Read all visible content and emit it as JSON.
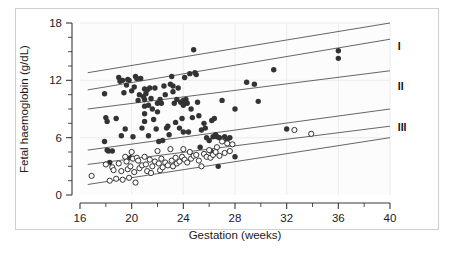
{
  "figure": {
    "background_color": "#ffffff",
    "plot_area_color": "#fcfcfc",
    "frame_color": "#cfcfcf",
    "axis_color": "#3a3a3a",
    "gridline_color": "#ececec",
    "reference_line_color": "#555555",
    "filled_marker_color": "#333333",
    "open_marker_edge_color": "#333333",
    "open_marker_fill_color": "#ffffff"
  },
  "chart_data": {
    "type": "scatter",
    "title": "",
    "subtitle": "",
    "xlabel": "Gestation (weeks)",
    "ylabel": "Fetal haemoglobin (g/dL)",
    "xlim": [
      16,
      40
    ],
    "ylim": [
      0,
      18
    ],
    "xticks": [
      16,
      20,
      24,
      28,
      32,
      36,
      40
    ],
    "xtick_labels": [
      "16",
      "20",
      "24",
      "28",
      "32",
      "36",
      "40"
    ],
    "xminor_ticks": [
      18,
      22,
      26,
      30,
      34,
      38
    ],
    "yticks": [
      0,
      6,
      12,
      18
    ],
    "ytick_labels": [
      "0",
      "6",
      "12",
      "18"
    ],
    "yminor_ticks": [
      1.5,
      3,
      4.5,
      7.5,
      9,
      10.5,
      13.5,
      15,
      16.5
    ],
    "grid": "vertical-major-faint",
    "legend": "none",
    "legend_position": "none",
    "annotations": [
      {
        "text": "I",
        "x": 40.6,
        "y": 15.6
      },
      {
        "text": "II",
        "x": 40.6,
        "y": 11.4
      },
      {
        "text": "III",
        "x": 40.6,
        "y": 7.1
      }
    ],
    "reference_lines": [
      {
        "name": "line-1",
        "x": [
          16.6,
          40.0
        ],
        "y": [
          12.8,
          18.0
        ]
      },
      {
        "name": "line-2",
        "x": [
          16.6,
          40.0
        ],
        "y": [
          11.0,
          16.3
        ]
      },
      {
        "name": "line-3",
        "x": [
          16.6,
          40.0
        ],
        "y": [
          9.0,
          13.0
        ]
      },
      {
        "name": "line-4",
        "x": [
          16.6,
          40.0
        ],
        "y": [
          4.7,
          9.0
        ]
      },
      {
        "name": "line-5",
        "x": [
          16.6,
          40.0
        ],
        "y": [
          3.2,
          7.2
        ]
      },
      {
        "name": "line-6",
        "x": [
          16.6,
          40.0
        ],
        "y": [
          1.1,
          6.0
        ]
      }
    ],
    "series": [
      {
        "name": "filled-circles",
        "marker": "filled-circle",
        "color": "#333333",
        "points": [
          [
            17.9,
            10.6
          ],
          [
            17.9,
            5.6
          ],
          [
            18.0,
            8.1
          ],
          [
            18.1,
            7.7
          ],
          [
            18.1,
            4.7
          ],
          [
            18.2,
            4.6
          ],
          [
            18.3,
            3.4
          ],
          [
            18.5,
            4.6
          ],
          [
            18.8,
            8.0
          ],
          [
            19.0,
            12.3
          ],
          [
            19.1,
            11.9
          ],
          [
            19.2,
            6.2
          ],
          [
            19.3,
            12.0
          ],
          [
            19.4,
            10.7
          ],
          [
            19.5,
            6.9
          ],
          [
            19.6,
            11.5
          ],
          [
            19.7,
            12.1
          ],
          [
            19.8,
            12.0
          ],
          [
            19.9,
            3.9
          ],
          [
            20.0,
            10.9
          ],
          [
            20.1,
            6.1
          ],
          [
            20.2,
            11.3
          ],
          [
            20.3,
            12.4
          ],
          [
            20.4,
            12.2
          ],
          [
            20.5,
            9.9
          ],
          [
            20.6,
            10.5
          ],
          [
            20.7,
            12.2
          ],
          [
            20.8,
            7.0
          ],
          [
            20.9,
            10.3
          ],
          [
            21.0,
            11.1
          ],
          [
            21.0,
            10.0
          ],
          [
            21.0,
            9.3
          ],
          [
            21.0,
            8.5
          ],
          [
            21.0,
            7.7
          ],
          [
            21.1,
            10.6
          ],
          [
            21.2,
            11.0
          ],
          [
            21.3,
            9.4
          ],
          [
            21.3,
            6.2
          ],
          [
            21.4,
            11.2
          ],
          [
            21.5,
            10.1
          ],
          [
            21.6,
            9.0
          ],
          [
            21.7,
            7.9
          ],
          [
            21.8,
            11.2
          ],
          [
            21.9,
            6.9
          ],
          [
            22.0,
            9.6
          ],
          [
            22.0,
            8.7
          ],
          [
            22.1,
            5.6
          ],
          [
            22.2,
            10.0
          ],
          [
            22.3,
            9.6
          ],
          [
            22.4,
            5.7
          ],
          [
            22.5,
            11.4
          ],
          [
            22.6,
            10.5
          ],
          [
            22.7,
            7.0
          ],
          [
            22.8,
            7.2
          ],
          [
            22.9,
            6.3
          ],
          [
            23.0,
            11.6
          ],
          [
            23.1,
            12.4
          ],
          [
            23.2,
            11.4
          ],
          [
            23.2,
            10.8
          ],
          [
            23.3,
            9.6
          ],
          [
            23.4,
            7.6
          ],
          [
            23.5,
            10.0
          ],
          [
            23.6,
            11.2
          ],
          [
            23.7,
            7.0
          ],
          [
            23.8,
            9.7
          ],
          [
            23.9,
            8.0
          ],
          [
            24.0,
            9.9
          ],
          [
            24.0,
            9.4
          ],
          [
            24.0,
            6.6
          ],
          [
            24.1,
            12.3
          ],
          [
            24.2,
            10.0
          ],
          [
            24.3,
            9.6
          ],
          [
            24.4,
            6.6
          ],
          [
            24.5,
            12.7
          ],
          [
            24.6,
            9.0
          ],
          [
            24.7,
            8.1
          ],
          [
            24.8,
            15.2
          ],
          [
            24.9,
            12.8
          ],
          [
            25.0,
            12.6
          ],
          [
            25.1,
            9.7
          ],
          [
            25.2,
            8.3
          ],
          [
            25.3,
            5.0
          ],
          [
            25.4,
            6.8
          ],
          [
            25.6,
            7.5
          ],
          [
            25.7,
            7.0
          ],
          [
            25.8,
            6.0
          ],
          [
            26.0,
            5.7
          ],
          [
            26.1,
            4.6
          ],
          [
            26.2,
            7.8
          ],
          [
            26.3,
            6.1
          ],
          [
            26.4,
            8.0
          ],
          [
            26.5,
            6.3
          ],
          [
            26.6,
            6.1
          ],
          [
            26.7,
            3.0
          ],
          [
            26.8,
            6.0
          ],
          [
            27.0,
            9.9
          ],
          [
            27.2,
            6.1
          ],
          [
            27.4,
            5.8
          ],
          [
            27.6,
            6.0
          ],
          [
            28.0,
            4.0
          ],
          [
            28.0,
            9.0
          ],
          [
            28.9,
            11.8
          ],
          [
            29.5,
            11.6
          ],
          [
            29.8,
            9.8
          ],
          [
            31.0,
            13.1
          ],
          [
            32.0,
            6.9
          ],
          [
            36.0,
            15.1
          ],
          [
            36.0,
            14.3
          ]
        ]
      },
      {
        "name": "open-circles",
        "marker": "open-circle",
        "color": "#333333",
        "points": [
          [
            16.9,
            2.0
          ],
          [
            18.0,
            3.2
          ],
          [
            18.3,
            1.5
          ],
          [
            18.5,
            2.9
          ],
          [
            18.6,
            2.6
          ],
          [
            18.8,
            1.7
          ],
          [
            19.0,
            3.3
          ],
          [
            19.2,
            2.5
          ],
          [
            19.3,
            1.6
          ],
          [
            19.5,
            4.0
          ],
          [
            19.6,
            3.5
          ],
          [
            19.7,
            2.7
          ],
          [
            19.8,
            1.8
          ],
          [
            19.9,
            3.0
          ],
          [
            20.0,
            4.5
          ],
          [
            20.1,
            3.8
          ],
          [
            20.2,
            2.4
          ],
          [
            20.3,
            1.3
          ],
          [
            20.4,
            3.9
          ],
          [
            20.5,
            3.6
          ],
          [
            20.6,
            2.8
          ],
          [
            20.8,
            3.1
          ],
          [
            21.0,
            4.0
          ],
          [
            21.1,
            3.2
          ],
          [
            21.2,
            2.5
          ],
          [
            21.4,
            3.7
          ],
          [
            21.5,
            2.3
          ],
          [
            21.6,
            3.0
          ],
          [
            21.8,
            3.5
          ],
          [
            22.0,
            4.6
          ],
          [
            22.1,
            3.3
          ],
          [
            22.2,
            2.6
          ],
          [
            22.3,
            3.8
          ],
          [
            22.4,
            2.9
          ],
          [
            22.6,
            3.4
          ],
          [
            22.8,
            3.1
          ],
          [
            23.0,
            4.8
          ],
          [
            23.1,
            3.6
          ],
          [
            23.2,
            3.0
          ],
          [
            23.4,
            3.9
          ],
          [
            23.5,
            3.3
          ],
          [
            23.7,
            3.5
          ],
          [
            23.9,
            4.0
          ],
          [
            24.0,
            4.8
          ],
          [
            24.1,
            3.7
          ],
          [
            24.3,
            3.4
          ],
          [
            24.5,
            4.5
          ],
          [
            24.6,
            3.8
          ],
          [
            24.8,
            4.1
          ],
          [
            25.0,
            4.2
          ],
          [
            25.2,
            3.6
          ],
          [
            25.4,
            3.0
          ],
          [
            25.6,
            4.3
          ],
          [
            25.8,
            4.0
          ],
          [
            26.0,
            4.7
          ],
          [
            26.1,
            3.9
          ],
          [
            26.3,
            4.2
          ],
          [
            26.5,
            4.5
          ],
          [
            26.6,
            5.0
          ],
          [
            26.8,
            4.1
          ],
          [
            27.0,
            5.6
          ],
          [
            27.2,
            4.4
          ],
          [
            27.4,
            5.4
          ],
          [
            27.6,
            4.6
          ],
          [
            27.8,
            5.3
          ],
          [
            32.6,
            6.8
          ],
          [
            33.9,
            6.4
          ]
        ]
      }
    ]
  }
}
